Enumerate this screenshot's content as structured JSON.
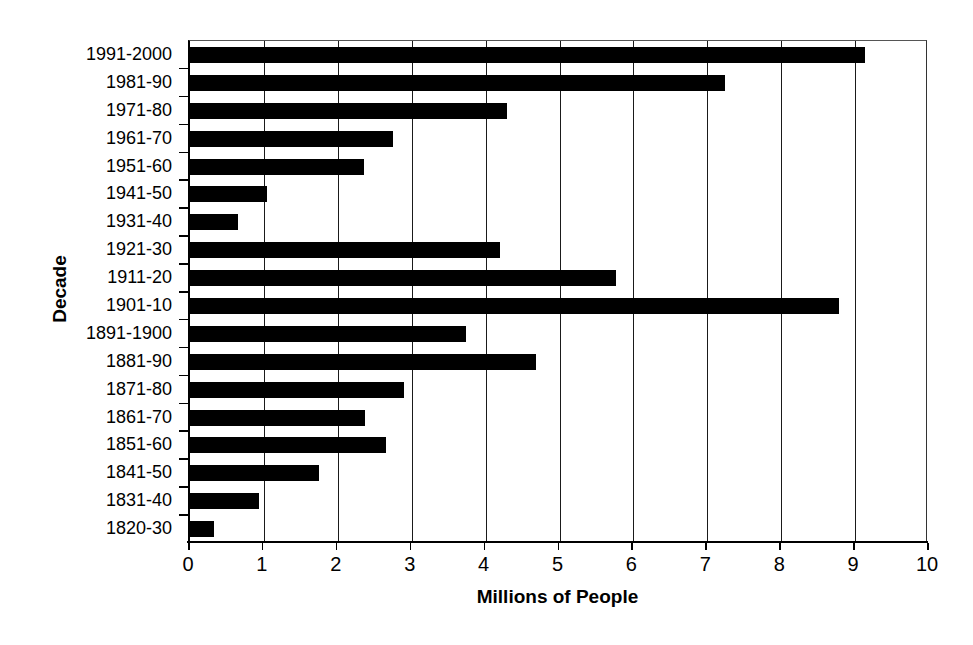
{
  "chart_data": {
    "type": "bar",
    "orientation": "horizontal",
    "title": "",
    "xlabel": "Millions of People",
    "ylabel": "Decade",
    "xlim": [
      0,
      10
    ],
    "xticks": [
      "0",
      "1",
      "2",
      "3",
      "4",
      "5",
      "6",
      "7",
      "8",
      "9",
      "10"
    ],
    "grid": "vertical",
    "legend": "none",
    "bar_color": "#000000",
    "categories": [
      "1991-2000",
      "1981-90",
      "1971-80",
      "1961-70",
      "1951-60",
      "1941-50",
      "1931-40",
      "1921-30",
      "1911-20",
      "1901-10",
      "1891-1900",
      "1881-90",
      "1871-80",
      "1861-70",
      "1851-60",
      "1841-50",
      "1831-40",
      "1820-30"
    ],
    "values": [
      9.13,
      7.24,
      4.29,
      2.75,
      2.36,
      1.04,
      0.65,
      4.2,
      5.76,
      8.78,
      3.74,
      4.68,
      2.9,
      2.37,
      2.65,
      1.75,
      0.93,
      0.33
    ]
  }
}
